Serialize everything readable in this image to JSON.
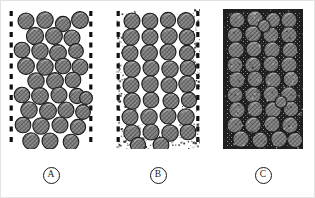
{
  "figure": {
    "title": "",
    "background_color": "#ffffff",
    "border_color": "#e3e3e3",
    "width": 315,
    "height": 198
  },
  "colors": {
    "grain_fill": "#8c8c8c",
    "grain_hatch": "#3a3a3a",
    "grain_outline": "#1a1a1a",
    "matrix_dark": "#1f1f1f",
    "speckle": "#2b2b2b",
    "void_white": "#ffffff",
    "label_text": "#1a1a1a",
    "boundary_dash": "#111111"
  },
  "panels": [
    {
      "id": "A",
      "label": "A",
      "caption_text": "A",
      "x": 8,
      "y": 8,
      "width": 84,
      "height": 140,
      "boundary_style": "dashed",
      "matrix_description": "grain-supported, open voids, no fine matrix",
      "matrix_density": 0.0,
      "speckle_count": 0,
      "grain_count": 34,
      "grains": [
        {
          "cx": 17,
          "cy": 12,
          "r": 8.0
        },
        {
          "cx": 36,
          "cy": 11,
          "r": 8.2
        },
        {
          "cx": 54,
          "cy": 15,
          "r": 7.6
        },
        {
          "cx": 71,
          "cy": 11,
          "r": 8.4
        },
        {
          "cx": 26,
          "cy": 27,
          "r": 8.6
        },
        {
          "cx": 45,
          "cy": 27,
          "r": 8.4
        },
        {
          "cx": 63,
          "cy": 29,
          "r": 8.0
        },
        {
          "cx": 13,
          "cy": 41,
          "r": 7.8
        },
        {
          "cx": 31,
          "cy": 42,
          "r": 8.2
        },
        {
          "cx": 49,
          "cy": 44,
          "r": 8.4
        },
        {
          "cx": 67,
          "cy": 42,
          "r": 7.4
        },
        {
          "cx": 17,
          "cy": 57,
          "r": 8.4
        },
        {
          "cx": 36,
          "cy": 58,
          "r": 8.2
        },
        {
          "cx": 54,
          "cy": 57,
          "r": 7.8
        },
        {
          "cx": 71,
          "cy": 58,
          "r": 8.0
        },
        {
          "cx": 27,
          "cy": 72,
          "r": 8.2
        },
        {
          "cx": 46,
          "cy": 72,
          "r": 8.4
        },
        {
          "cx": 64,
          "cy": 71,
          "r": 7.8
        },
        {
          "cx": 13,
          "cy": 86,
          "r": 7.8
        },
        {
          "cx": 31,
          "cy": 87,
          "r": 8.4
        },
        {
          "cx": 50,
          "cy": 86,
          "r": 8.0
        },
        {
          "cx": 68,
          "cy": 87,
          "r": 7.6
        },
        {
          "cx": 20,
          "cy": 101,
          "r": 8.2
        },
        {
          "cx": 39,
          "cy": 102,
          "r": 8.4
        },
        {
          "cx": 57,
          "cy": 101,
          "r": 8.0
        },
        {
          "cx": 74,
          "cy": 103,
          "r": 7.4
        },
        {
          "cx": 14,
          "cy": 116,
          "r": 7.8
        },
        {
          "cx": 32,
          "cy": 117,
          "r": 8.2
        },
        {
          "cx": 51,
          "cy": 116,
          "r": 8.0
        },
        {
          "cx": 69,
          "cy": 118,
          "r": 7.6
        },
        {
          "cx": 22,
          "cy": 132,
          "r": 8.2
        },
        {
          "cx": 41,
          "cy": 132,
          "r": 8.0
        },
        {
          "cx": 62,
          "cy": 133,
          "r": 7.8
        },
        {
          "cx": 77,
          "cy": 89,
          "r": 6.4
        }
      ]
    },
    {
      "id": "B",
      "label": "B",
      "caption_text": "B",
      "x": 115,
      "y": 8,
      "width": 84,
      "height": 140,
      "boundary_style": "dashed",
      "matrix_description": "grain-supported with partial fine matrix infill near margins",
      "matrix_density": 0.35,
      "speckle_count": 430,
      "grain_count": 34,
      "grains": [
        {
          "cx": 16,
          "cy": 12,
          "r": 8.0
        },
        {
          "cx": 34,
          "cy": 12,
          "r": 7.8
        },
        {
          "cx": 52,
          "cy": 11,
          "r": 7.6
        },
        {
          "cx": 70,
          "cy": 12,
          "r": 8.4
        },
        {
          "cx": 15,
          "cy": 28,
          "r": 8.2
        },
        {
          "cx": 34,
          "cy": 28,
          "r": 8.0
        },
        {
          "cx": 53,
          "cy": 27,
          "r": 8.2
        },
        {
          "cx": 71,
          "cy": 28,
          "r": 7.8
        },
        {
          "cx": 14,
          "cy": 44,
          "r": 8.0
        },
        {
          "cx": 33,
          "cy": 44,
          "r": 8.4
        },
        {
          "cx": 52,
          "cy": 43,
          "r": 8.0
        },
        {
          "cx": 71,
          "cy": 44,
          "r": 7.6
        },
        {
          "cx": 16,
          "cy": 60,
          "r": 8.2
        },
        {
          "cx": 35,
          "cy": 59,
          "r": 8.0
        },
        {
          "cx": 54,
          "cy": 60,
          "r": 8.2
        },
        {
          "cx": 72,
          "cy": 59,
          "r": 7.8
        },
        {
          "cx": 15,
          "cy": 76,
          "r": 8.0
        },
        {
          "cx": 34,
          "cy": 75,
          "r": 8.2
        },
        {
          "cx": 53,
          "cy": 76,
          "r": 8.0
        },
        {
          "cx": 71,
          "cy": 75,
          "r": 8.2
        },
        {
          "cx": 16,
          "cy": 92,
          "r": 8.2
        },
        {
          "cx": 35,
          "cy": 91,
          "r": 7.8
        },
        {
          "cx": 55,
          "cy": 92,
          "r": 8.0
        },
        {
          "cx": 73,
          "cy": 91,
          "r": 7.6
        },
        {
          "cx": 14,
          "cy": 108,
          "r": 8.0
        },
        {
          "cx": 33,
          "cy": 108,
          "r": 8.2
        },
        {
          "cx": 52,
          "cy": 107,
          "r": 8.0
        },
        {
          "cx": 70,
          "cy": 108,
          "r": 8.2
        },
        {
          "cx": 16,
          "cy": 124,
          "r": 8.2
        },
        {
          "cx": 35,
          "cy": 123,
          "r": 8.0
        },
        {
          "cx": 54,
          "cy": 124,
          "r": 8.2
        },
        {
          "cx": 72,
          "cy": 123,
          "r": 7.8
        },
        {
          "cx": 22,
          "cy": 136,
          "r": 7.6
        },
        {
          "cx": 45,
          "cy": 136,
          "r": 7.8
        }
      ]
    },
    {
      "id": "C",
      "label": "C",
      "caption_text": "C",
      "x": 222,
      "y": 8,
      "width": 80,
      "height": 140,
      "boundary_style": "solid-dark",
      "matrix_description": "matrix-supported, voids completely filled with dark fine matrix",
      "matrix_density": 1.0,
      "speckle_count": 900,
      "grain_count": 38,
      "grains": [
        {
          "cx": 14,
          "cy": 11,
          "r": 8.0
        },
        {
          "cx": 32,
          "cy": 10,
          "r": 8.2
        },
        {
          "cx": 50,
          "cy": 11,
          "r": 7.6
        },
        {
          "cx": 66,
          "cy": 11,
          "r": 8.0
        },
        {
          "cx": 12,
          "cy": 26,
          "r": 7.8
        },
        {
          "cx": 30,
          "cy": 25,
          "r": 8.4
        },
        {
          "cx": 48,
          "cy": 26,
          "r": 8.0
        },
        {
          "cx": 66,
          "cy": 26,
          "r": 8.2
        },
        {
          "cx": 13,
          "cy": 41,
          "r": 8.2
        },
        {
          "cx": 31,
          "cy": 40,
          "r": 8.0
        },
        {
          "cx": 49,
          "cy": 41,
          "r": 8.2
        },
        {
          "cx": 67,
          "cy": 41,
          "r": 7.8
        },
        {
          "cx": 12,
          "cy": 56,
          "r": 8.0
        },
        {
          "cx": 30,
          "cy": 56,
          "r": 8.2
        },
        {
          "cx": 48,
          "cy": 55,
          "r": 8.0
        },
        {
          "cx": 66,
          "cy": 56,
          "r": 8.2
        },
        {
          "cx": 14,
          "cy": 71,
          "r": 8.2
        },
        {
          "cx": 32,
          "cy": 70,
          "r": 8.0
        },
        {
          "cx": 50,
          "cy": 71,
          "r": 8.2
        },
        {
          "cx": 68,
          "cy": 70,
          "r": 7.8
        },
        {
          "cx": 12,
          "cy": 86,
          "r": 8.0
        },
        {
          "cx": 30,
          "cy": 86,
          "r": 8.2
        },
        {
          "cx": 48,
          "cy": 85,
          "r": 8.0
        },
        {
          "cx": 66,
          "cy": 86,
          "r": 8.2
        },
        {
          "cx": 14,
          "cy": 101,
          "r": 8.2
        },
        {
          "cx": 32,
          "cy": 100,
          "r": 8.0
        },
        {
          "cx": 50,
          "cy": 101,
          "r": 8.2
        },
        {
          "cx": 68,
          "cy": 100,
          "r": 7.8
        },
        {
          "cx": 12,
          "cy": 116,
          "r": 8.0
        },
        {
          "cx": 30,
          "cy": 116,
          "r": 8.2
        },
        {
          "cx": 49,
          "cy": 115,
          "r": 8.0
        },
        {
          "cx": 67,
          "cy": 116,
          "r": 8.2
        },
        {
          "cx": 18,
          "cy": 130,
          "r": 8.2
        },
        {
          "cx": 37,
          "cy": 131,
          "r": 8.0
        },
        {
          "cx": 56,
          "cy": 130,
          "r": 8.2
        },
        {
          "cx": 72,
          "cy": 131,
          "r": 7.6
        },
        {
          "cx": 41,
          "cy": 17,
          "r": 6.2
        },
        {
          "cx": 58,
          "cy": 93,
          "r": 6.0
        }
      ]
    }
  ],
  "captions": [
    {
      "label": "A",
      "x": 50,
      "y": 166
    },
    {
      "label": "B",
      "x": 157,
      "y": 166
    },
    {
      "label": "C",
      "x": 262,
      "y": 166
    }
  ]
}
